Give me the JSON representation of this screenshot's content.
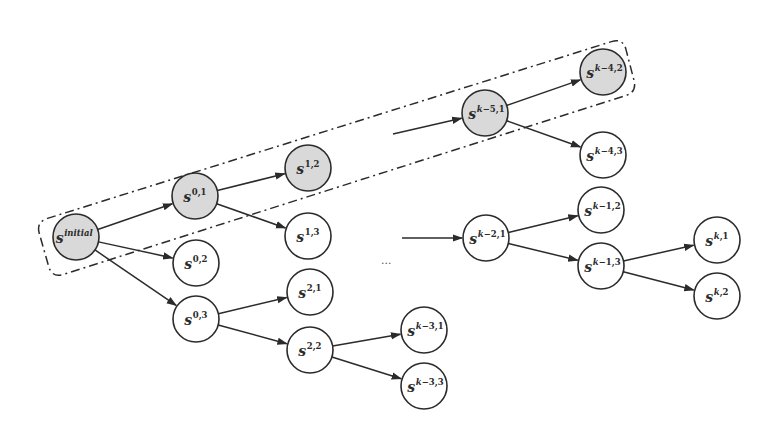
{
  "diagram": {
    "type": "search-tree",
    "colors": {
      "highlight_fill": "#d9d9d9",
      "default_fill": "#ffffff",
      "stroke": "#2b2b2b"
    },
    "node_radius": 23,
    "nodes": [
      {
        "id": "initial",
        "base": "s",
        "sup": "initial",
        "x": 76,
        "y": 237,
        "highlighted": true
      },
      {
        "id": "0,1",
        "base": "s",
        "sup": "0,1",
        "x": 195,
        "y": 196,
        "highlighted": true
      },
      {
        "id": "0,2",
        "base": "s",
        "sup": "0,2",
        "x": 196,
        "y": 263,
        "highlighted": false
      },
      {
        "id": "0,3",
        "base": "s",
        "sup": "0,3",
        "x": 196,
        "y": 319,
        "highlighted": false
      },
      {
        "id": "1,2",
        "base": "s",
        "sup": "1,2",
        "x": 308,
        "y": 168,
        "highlighted": true
      },
      {
        "id": "1,3",
        "base": "s",
        "sup": "1,3",
        "x": 308,
        "y": 236,
        "highlighted": false
      },
      {
        "id": "2,1",
        "base": "s",
        "sup": "2,1",
        "x": 310,
        "y": 292,
        "highlighted": false
      },
      {
        "id": "2,2",
        "base": "s",
        "sup": "2,2",
        "x": 310,
        "y": 350,
        "highlighted": false
      },
      {
        "id": "k-3,1",
        "base": "s",
        "sup": "k−3,1",
        "x": 424,
        "y": 330,
        "highlighted": false
      },
      {
        "id": "k-3,3",
        "base": "s",
        "sup": "k−3,3",
        "x": 424,
        "y": 386,
        "highlighted": false
      },
      {
        "id": "k-5,1",
        "base": "s",
        "sup": "k−5,1",
        "x": 485,
        "y": 113,
        "highlighted": true
      },
      {
        "id": "k-4,2",
        "base": "s",
        "sup": "k−4,2",
        "x": 603,
        "y": 72,
        "highlighted": true
      },
      {
        "id": "k-4,3",
        "base": "s",
        "sup": "k−4,3",
        "x": 603,
        "y": 155,
        "highlighted": false
      },
      {
        "id": "k-2,1",
        "base": "s",
        "sup": "k−2,1",
        "x": 486,
        "y": 238,
        "highlighted": false
      },
      {
        "id": "k-1,2",
        "base": "s",
        "sup": "k−1,2",
        "x": 601,
        "y": 210,
        "highlighted": false
      },
      {
        "id": "k-1,3",
        "base": "s",
        "sup": "k−1,3",
        "x": 601,
        "y": 266,
        "highlighted": false
      },
      {
        "id": "k,1",
        "base": "s",
        "sup": "k,1",
        "x": 717,
        "y": 240,
        "highlighted": false
      },
      {
        "id": "k,2",
        "base": "s",
        "sup": "k,2",
        "x": 717,
        "y": 296,
        "highlighted": false
      }
    ],
    "edges": [
      {
        "from": "initial",
        "to": "0,1"
      },
      {
        "from": "initial",
        "to": "0,2"
      },
      {
        "from": "initial",
        "to": "0,3"
      },
      {
        "from": "0,1",
        "to": "1,2"
      },
      {
        "from": "0,1",
        "to": "1,3"
      },
      {
        "from": "0,3",
        "to": "2,1"
      },
      {
        "from": "0,3",
        "to": "2,2"
      },
      {
        "from": "2,2",
        "to": "k-3,1"
      },
      {
        "from": "2,2",
        "to": "k-3,3"
      },
      {
        "from": "k-5,1",
        "to": "k-4,2"
      },
      {
        "from": "k-5,1",
        "to": "k-4,3"
      },
      {
        "from": "k-2,1",
        "to": "k-1,2"
      },
      {
        "from": "k-2,1",
        "to": "k-1,3"
      },
      {
        "from": "k-1,3",
        "to": "k,1"
      },
      {
        "from": "k-1,3",
        "to": "k,2"
      }
    ],
    "dangling_arrows": [
      {
        "x1": 393,
        "y1": 134,
        "to": "k-5,1"
      },
      {
        "x1": 402,
        "y1": 238,
        "to": "k-2,1"
      }
    ],
    "ellipsis": {
      "text": "...",
      "x": 381,
      "y": 264
    },
    "selected_path_box": {
      "style": "dash-dot",
      "label": "highlighted trajectory",
      "corners": [
        [
          36,
          222
        ],
        [
          623,
          38
        ],
        [
          637,
          92
        ],
        [
          52,
          278
        ]
      ]
    }
  }
}
